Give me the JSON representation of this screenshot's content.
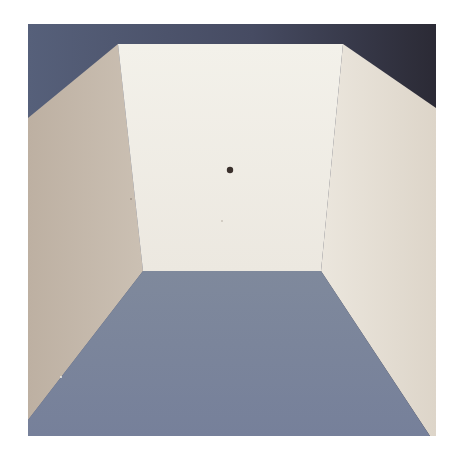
{
  "image": {
    "description": "Painting / photograph of an empty room-like box interior viewed in one-point perspective: a pale back wall with a small dark dot, beige side walls, slate-blue floor and dark blue-gray ceiling band",
    "colors": {
      "page_background": "#ffffff",
      "ceiling_left": "#545c77",
      "ceiling_right": "#2e2d3a",
      "back_wall": "#f0ede6",
      "left_wall": "#c4b8aa",
      "right_wall": "#e2dbd0",
      "floor": "#7a8498",
      "dot": "#3a302c"
    }
  }
}
